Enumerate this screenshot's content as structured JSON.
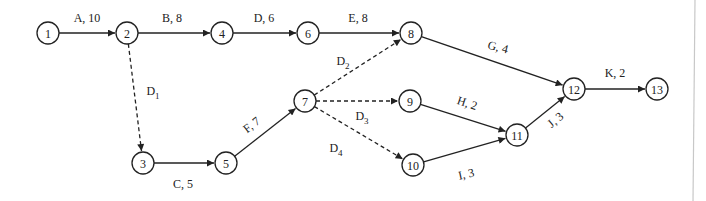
{
  "diagram": {
    "type": "activity-on-arrow network",
    "nodes": [
      {
        "id": "1",
        "x": 48,
        "y": 33
      },
      {
        "id": "2",
        "x": 127,
        "y": 33
      },
      {
        "id": "3",
        "x": 143,
        "y": 163
      },
      {
        "id": "4",
        "x": 222,
        "y": 33
      },
      {
        "id": "5",
        "x": 226,
        "y": 163
      },
      {
        "id": "6",
        "x": 308,
        "y": 33
      },
      {
        "id": "7",
        "x": 305,
        "y": 101
      },
      {
        "id": "8",
        "x": 411,
        "y": 33
      },
      {
        "id": "9",
        "x": 410,
        "y": 101
      },
      {
        "id": "10",
        "x": 413,
        "y": 165
      },
      {
        "id": "11",
        "x": 517,
        "y": 135
      },
      {
        "id": "12",
        "x": 574,
        "y": 89
      },
      {
        "id": "13",
        "x": 657,
        "y": 89
      }
    ],
    "edges": [
      {
        "from": "1",
        "to": "2",
        "activity": "A",
        "duration": "10",
        "dashed": false,
        "label": "A, 10",
        "lx": 87,
        "ly": 22,
        "rot": 0
      },
      {
        "from": "2",
        "to": "4",
        "activity": "B",
        "duration": "8",
        "dashed": false,
        "label": "B, 8",
        "lx": 172,
        "ly": 22,
        "rot": 0
      },
      {
        "from": "4",
        "to": "6",
        "activity": "D",
        "duration": "6",
        "dashed": false,
        "label": "D, 6",
        "lx": 264,
        "ly": 22,
        "rot": 0
      },
      {
        "from": "6",
        "to": "8",
        "activity": "E",
        "duration": "8",
        "dashed": false,
        "label": "E, 8",
        "lx": 358,
        "ly": 22,
        "rot": 0
      },
      {
        "from": "8",
        "to": "12",
        "activity": "G",
        "duration": "4",
        "dashed": false,
        "label": "G, 4",
        "lx": 497,
        "ly": 51,
        "rot": 14
      },
      {
        "from": "2",
        "to": "3",
        "activity": "D",
        "sub": "1",
        "dashed": true,
        "label": "D",
        "lx": 153,
        "ly": 95,
        "rot": 0
      },
      {
        "from": "3",
        "to": "5",
        "activity": "C",
        "duration": "5",
        "dashed": false,
        "label": "C, 5",
        "lx": 183,
        "ly": 188,
        "rot": 0
      },
      {
        "from": "5",
        "to": "7",
        "activity": "F",
        "duration": "7",
        "dashed": false,
        "label": "F, 7",
        "lx": 254,
        "ly": 128,
        "rot": -38
      },
      {
        "from": "7",
        "to": "8",
        "activity": "D",
        "sub": "2",
        "dashed": true,
        "label": "D",
        "lx": 343,
        "ly": 65,
        "rot": 0
      },
      {
        "from": "7",
        "to": "9",
        "activity": "D",
        "sub": "3",
        "dashed": true,
        "label": "D",
        "lx": 362,
        "ly": 120,
        "rot": 0
      },
      {
        "from": "7",
        "to": "10",
        "activity": "D",
        "sub": "4",
        "dashed": true,
        "label": "D",
        "lx": 336,
        "ly": 152,
        "rot": 0
      },
      {
        "from": "9",
        "to": "11",
        "activity": "H",
        "duration": "2",
        "dashed": false,
        "label": "H, 2",
        "lx": 466,
        "ly": 107,
        "rot": 18
      },
      {
        "from": "10",
        "to": "11",
        "activity": "I",
        "duration": "3",
        "dashed": false,
        "label": "I, 3",
        "lx": 467,
        "ly": 178,
        "rot": -12
      },
      {
        "from": "11",
        "to": "12",
        "activity": "J",
        "duration": "3",
        "dashed": false,
        "label": "J, 3",
        "lx": 558,
        "ly": 123,
        "rot": -40
      },
      {
        "from": "12",
        "to": "13",
        "activity": "K",
        "duration": "2",
        "dashed": false,
        "label": "K, 2",
        "lx": 615,
        "ly": 77,
        "rot": 0
      }
    ],
    "node_radius": 11
  },
  "colors": {
    "stroke": "#222222",
    "background": "#ffffff",
    "divider": "#c8c8c8"
  }
}
